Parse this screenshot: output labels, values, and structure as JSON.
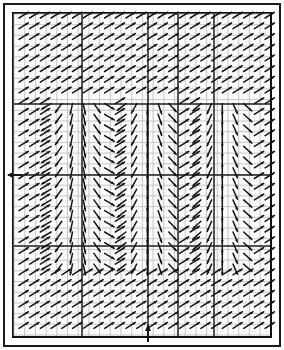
{
  "figure": {
    "title": "",
    "type": "vector-field",
    "background_color": "#ffffff",
    "frame_color": "#1a1a1a",
    "arrow_color": "#151515",
    "grid_color": "#b9b9b9",
    "grid_major_color": "#1d1d1d",
    "plot_area": {
      "x": 14,
      "y": 14,
      "width": 256,
      "height": 322
    }
  },
  "axes": {
    "x_axis_marker": {
      "name": "x-origin-arrow",
      "x": 148,
      "direction": "up",
      "label": ""
    },
    "y_axis_marker": {
      "name": "y-origin-tick",
      "y": 175,
      "direction": "left",
      "label": ""
    },
    "major_gridlines_x": [
      82,
      148,
      178,
      214
    ],
    "major_gridlines_y": [
      104,
      175,
      246
    ],
    "grid_spacing": 10.7,
    "grid_visible": true,
    "tick_labels_x": [],
    "tick_labels_y": []
  },
  "chart_data": {
    "type": "scatter",
    "title": "",
    "xlabel": "",
    "ylabel": "",
    "subtitle": "",
    "legend": [],
    "grid": true,
    "xlim": [
      0,
      24
    ],
    "ylim": [
      0,
      30
    ],
    "description": "Quiver / vector field showing three vertical convergence bands with downward-converging flow and uniform northeast flow in the outer regions",
    "nx": 24,
    "ny": 30,
    "convergence_band_centers_x": [
      5.5,
      12.2,
      19.0
    ],
    "convergence_band_half_width": 2.6,
    "convergence_rows_y": [
      8,
      23
    ],
    "arrow_length": 11,
    "arrow_head_size": 3.2,
    "default_angle_deg": -32,
    "converge_max_angle_deg": 62,
    "series": [
      {
        "name": "uniform-flow",
        "angle_deg": -32,
        "region": "outside-bands"
      },
      {
        "name": "convergent-flow-left",
        "center_x": 5.5,
        "region": "band-1"
      },
      {
        "name": "convergent-flow-center",
        "center_x": 12.2,
        "region": "band-2"
      },
      {
        "name": "convergent-flow-right",
        "center_x": 19.0,
        "region": "band-3"
      }
    ]
  }
}
